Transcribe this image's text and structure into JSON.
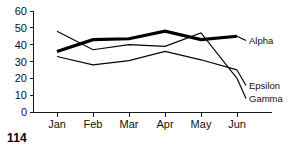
{
  "page": {
    "number": "114"
  },
  "chart_data": {
    "type": "line",
    "title": "",
    "subtitle": "",
    "xlabel": "",
    "ylabel": "",
    "categories": [
      "Jan",
      "Feb",
      "Mar",
      "Apr",
      "May",
      "Jun"
    ],
    "ylim": [
      0,
      60
    ],
    "yticks": [
      0,
      10,
      20,
      30,
      40,
      50,
      60
    ],
    "ytick_labels": [
      "0",
      "10",
      "20",
      "30",
      "40",
      "50",
      "60"
    ],
    "grid": false,
    "legend_position": "right-inline-labels",
    "series": [
      {
        "name": "Alpha",
        "label": "Alpha",
        "emphasis": "thick",
        "color": "#000000",
        "values": [
          36,
          43,
          43.5,
          48,
          43,
          45
        ]
      },
      {
        "name": "Epsilon",
        "label": "Epsilon",
        "emphasis": "thin",
        "color": "#000000",
        "values": [
          33,
          28,
          30.5,
          36,
          31,
          25
        ]
      },
      {
        "name": "Gamma",
        "label": "Gamma",
        "emphasis": "thin",
        "color": "#000000",
        "values": [
          48,
          37,
          40,
          39,
          47,
          20
        ]
      }
    ]
  }
}
